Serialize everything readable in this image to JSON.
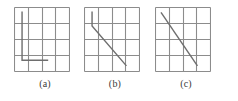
{
  "figure": {
    "background_color": "#ffffff",
    "width": 238,
    "height": 101
  },
  "style": {
    "grid_color": "#8c8c8c",
    "grid_line_width": 1.1,
    "path_color": "#6e6e6e",
    "path_line_width": 1.4,
    "border_color": "#8c8c8c",
    "caption_color": "#3a3a3a"
  },
  "chart_data": {
    "type": "line",
    "xlabel": "",
    "ylabel": "",
    "xlim": [
      0,
      4
    ],
    "ylim": [
      0,
      4
    ],
    "grid": true,
    "legend_position": "none",
    "panels": [
      {
        "id": "a",
        "caption": "(a)",
        "description": "axis-aligned staircase path on a 4x4 grid",
        "grid": {
          "columns": 4,
          "rows": 4
        },
        "path_kind": "rectilinear",
        "points": [
          [
            0.55,
            3.75
          ],
          [
            0.55,
            0.7
          ],
          [
            2.45,
            0.7
          ]
        ]
      },
      {
        "id": "b",
        "caption": "(b)",
        "description": "short vertical segment joined to a diagonal segment",
        "grid": {
          "columns": 4,
          "rows": 4
        },
        "path_kind": "polyline",
        "points": [
          [
            0.55,
            3.75
          ],
          [
            0.55,
            2.85
          ],
          [
            3.05,
            0.35
          ]
        ]
      },
      {
        "id": "c",
        "caption": "(c)",
        "description": "single straight diagonal segment",
        "grid": {
          "columns": 4,
          "rows": 4
        },
        "path_kind": "straight",
        "points": [
          [
            0.4,
            3.7
          ],
          [
            3.05,
            0.35
          ]
        ]
      }
    ]
  },
  "captions": {
    "a": "(a)",
    "b": "(b)",
    "c": "(c)"
  }
}
